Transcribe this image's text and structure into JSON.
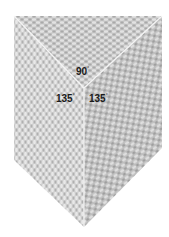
{
  "diagram": {
    "colors": {
      "background": "#ffffff",
      "top_panel": "#c9c9c9",
      "left_panel": "#d2d2d2",
      "right_panel": "#bdbdbd",
      "seam": "#f4f4f4",
      "label": "#1a1a1a"
    },
    "shape": {
      "top_left": [
        14,
        16
      ],
      "top_right": [
        162,
        16
      ],
      "right_shoulder": [
        162,
        148
      ],
      "bottom_point": [
        84,
        227
      ],
      "left_shoulder": [
        14,
        160
      ],
      "center": [
        84,
        88
      ]
    },
    "angles": [
      {
        "id": "top",
        "value": "90",
        "unit": "°"
      },
      {
        "id": "left",
        "value": "135",
        "unit": "°"
      },
      {
        "id": "right",
        "value": "135",
        "unit": "°"
      }
    ]
  }
}
